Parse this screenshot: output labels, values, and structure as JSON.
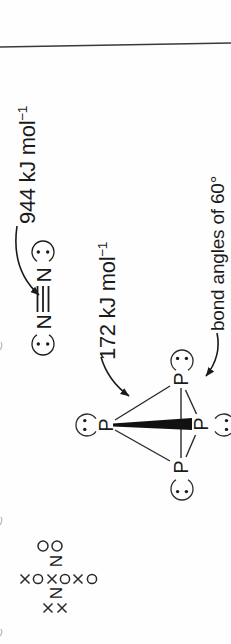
{
  "page": {
    "background": "#fefefe",
    "ink": "#1b1b1b",
    "rule_line_color": "#3a3a3a",
    "orientation": "figure rotated 90deg counterclockwise"
  },
  "n2_structure": {
    "left_atom": "N",
    "right_atom": "N",
    "bond": "triple",
    "energy_label": {
      "value": "944 kJ mol",
      "exponent": "−1"
    }
  },
  "p4_structure": {
    "apex_atom": "P",
    "left_atom": "P",
    "right_atom": "P",
    "front_atom": "P",
    "energy_label": {
      "value": "172 kJ mol",
      "exponent": "−1"
    },
    "angle_label": "bond angles of 60°"
  },
  "dot_cross_n2": {
    "left_atom": "N",
    "right_atom": "N",
    "left_lone_pair": "xx",
    "right_lone_pair": "oo",
    "shared_electrons": "xoxoxo"
  }
}
